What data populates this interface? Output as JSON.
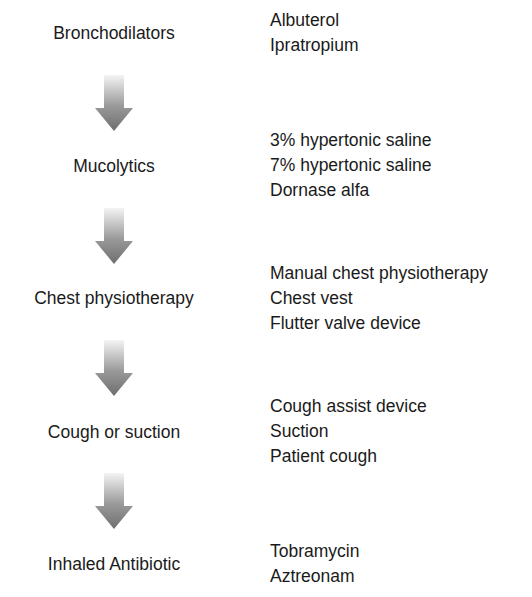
{
  "steps": [
    {
      "label": "Bronchodilators",
      "items": [
        "Albuterol",
        "Ipratropium"
      ]
    },
    {
      "label": "Mucolytics",
      "items": [
        "3% hypertonic saline",
        "7% hypertonic saline",
        "Dornase alfa"
      ]
    },
    {
      "label": "Chest physiotherapy",
      "items": [
        "Manual chest physiotherapy",
        "Chest vest",
        "Flutter valve device"
      ]
    },
    {
      "label": "Cough or suction",
      "items": [
        "Cough assist device",
        "Suction",
        "Patient cough"
      ]
    },
    {
      "label": "Inhaled Antibiotic",
      "items": [
        "Tobramycin",
        "Aztreonam"
      ]
    }
  ],
  "arrow_icon": "down-arrow-gradient",
  "colors": {
    "text": "#1a1a1a",
    "arrow_top": "#f2f2f2",
    "arrow_bottom": "#7a7a7a"
  }
}
